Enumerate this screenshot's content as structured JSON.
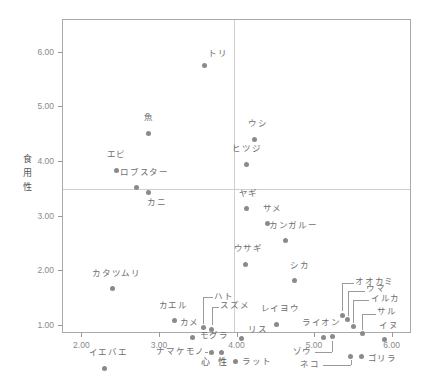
{
  "chart_data": {
    "type": "scatter",
    "title": "",
    "xlabel": "心 性",
    "ylabel": "食用性",
    "ylabel_chars": [
      "食",
      "用",
      "性"
    ],
    "xlim": [
      1.75,
      6.25
    ],
    "ylim": [
      0.85,
      6.6
    ],
    "grid": false,
    "legend": "none",
    "x_ticks": [
      2.0,
      3.0,
      4.0,
      5.0,
      6.0
    ],
    "x_tick_labels": [
      "2.00",
      "3.00",
      "4.00",
      "5.00",
      "6.00"
    ],
    "y_ticks": [
      1.0,
      2.0,
      3.0,
      4.0,
      5.0,
      6.0
    ],
    "y_tick_labels": [
      "1.00",
      "2.00",
      "3.00",
      "4.00",
      "5.00",
      "6.00"
    ],
    "reference_lines": {
      "vertical_x": 3.95,
      "horizontal_y": 3.5,
      "color": "#cfcfcf"
    },
    "marker_color": "#8a8a8a",
    "label_color": "#6e6e6e",
    "frame_color": "#aaaaaa",
    "points": [
      {
        "name": "トリ",
        "x": 3.57,
        "y": 5.76,
        "lx": 3.62,
        "ly": 5.98,
        "anchor": "left",
        "leader": false
      },
      {
        "name": "魚",
        "x": 2.85,
        "y": 4.52,
        "lx": 2.86,
        "ly": 4.8,
        "anchor": "center",
        "leader": false
      },
      {
        "name": "ウシ",
        "x": 4.22,
        "y": 4.42,
        "lx": 4.26,
        "ly": 4.7,
        "anchor": "center",
        "leader": false
      },
      {
        "name": "ヒツジ",
        "x": 4.11,
        "y": 3.96,
        "lx": 4.12,
        "ly": 4.24,
        "anchor": "center",
        "leader": false
      },
      {
        "name": "エビ",
        "x": 2.44,
        "y": 3.84,
        "lx": 2.44,
        "ly": 4.12,
        "anchor": "center",
        "leader": false
      },
      {
        "name": "ロブスター",
        "x": 2.7,
        "y": 3.53,
        "lx": 2.8,
        "ly": 3.8,
        "anchor": "center",
        "leader": false
      },
      {
        "name": "カニ",
        "x": 2.85,
        "y": 3.45,
        "lx": 2.96,
        "ly": 3.24,
        "anchor": "center",
        "leader": false
      },
      {
        "name": "ヤギ",
        "x": 4.12,
        "y": 3.15,
        "lx": 4.14,
        "ly": 3.42,
        "anchor": "center",
        "leader": false
      },
      {
        "name": "サメ",
        "x": 4.39,
        "y": 2.87,
        "lx": 4.45,
        "ly": 3.14,
        "anchor": "center",
        "leader": false
      },
      {
        "name": "カンガルー",
        "x": 4.62,
        "y": 2.56,
        "lx": 4.72,
        "ly": 2.82,
        "anchor": "center",
        "leader": false
      },
      {
        "name": "ウサギ",
        "x": 4.1,
        "y": 2.13,
        "lx": 4.14,
        "ly": 2.4,
        "anchor": "center",
        "leader": false
      },
      {
        "name": "シカ",
        "x": 4.73,
        "y": 1.83,
        "lx": 4.8,
        "ly": 2.1,
        "anchor": "center",
        "leader": false
      },
      {
        "name": "カタツムリ",
        "x": 2.39,
        "y": 1.68,
        "lx": 2.44,
        "ly": 1.95,
        "anchor": "center",
        "leader": false
      },
      {
        "name": "オオカミ",
        "x": 5.35,
        "y": 1.19,
        "lx": 5.52,
        "ly": 1.8,
        "anchor": "left",
        "leader": true,
        "leader_path": [
          [
            5.35,
            1.27
          ],
          [
            5.35,
            1.78
          ],
          [
            5.5,
            1.78
          ]
        ]
      },
      {
        "name": "カエル",
        "x": 3.19,
        "y": 1.1,
        "lx": 3.17,
        "ly": 1.37,
        "anchor": "center",
        "leader": false
      },
      {
        "name": "ハト",
        "x": 3.56,
        "y": 0.97,
        "lx": 3.7,
        "ly": 1.53,
        "anchor": "left",
        "leader": true,
        "leader_path": [
          [
            3.56,
            1.04
          ],
          [
            3.56,
            1.52
          ],
          [
            3.68,
            1.52
          ]
        ]
      },
      {
        "name": "ウマ",
        "x": 5.42,
        "y": 1.11,
        "lx": 5.66,
        "ly": 1.68,
        "anchor": "left",
        "leader": true,
        "leader_path": [
          [
            5.42,
            1.18
          ],
          [
            5.42,
            1.64
          ],
          [
            5.64,
            1.64
          ]
        ]
      },
      {
        "name": "レイヨウ",
        "x": 4.5,
        "y": 1.02,
        "lx": 4.55,
        "ly": 1.3,
        "anchor": "center",
        "leader": false
      },
      {
        "name": "スズメ",
        "x": 3.67,
        "y": 0.94,
        "lx": 3.78,
        "ly": 1.36,
        "anchor": "left",
        "leader": true,
        "leader_path": [
          [
            3.67,
            1.01
          ],
          [
            3.67,
            1.35
          ],
          [
            3.76,
            1.35
          ]
        ]
      },
      {
        "name": "イルカ",
        "x": 5.49,
        "y": 0.98,
        "lx": 5.72,
        "ly": 1.5,
        "anchor": "left",
        "leader": true,
        "leader_path": [
          [
            5.49,
            1.05
          ],
          [
            5.49,
            1.47
          ],
          [
            5.7,
            1.47
          ]
        ]
      },
      {
        "name": "ライオン",
        "x": 5.11,
        "y": 0.79,
        "lx": 5.08,
        "ly": 1.06,
        "anchor": "center",
        "leader": false
      },
      {
        "name": "サル",
        "x": 5.61,
        "y": 0.86,
        "lx": 5.8,
        "ly": 1.25,
        "anchor": "left",
        "leader": true,
        "leader_path": [
          [
            5.61,
            0.93
          ],
          [
            5.61,
            1.22
          ],
          [
            5.78,
            1.22
          ]
        ]
      },
      {
        "name": "カメ",
        "x": 3.42,
        "y": 0.78,
        "lx": 3.38,
        "ly": 1.06,
        "anchor": "center",
        "leader": false
      },
      {
        "name": "リス",
        "x": 4.05,
        "y": 0.77,
        "lx": 4.14,
        "ly": 0.93,
        "anchor": "left",
        "leader": false
      },
      {
        "name": "イヌ",
        "x": 5.89,
        "y": 0.75,
        "lx": 5.95,
        "ly": 1.0,
        "anchor": "center",
        "leader": false
      },
      {
        "name": "モグラ",
        "x": 3.79,
        "y": 0.52,
        "lx": 3.7,
        "ly": 0.82,
        "anchor": "center",
        "leader": false
      },
      {
        "name": "ゾウ",
        "x": 5.22,
        "y": 0.8,
        "lx": 4.96,
        "ly": 0.52,
        "anchor": "right",
        "leader": true,
        "leader_path": [
          [
            5.22,
            0.73
          ],
          [
            5.22,
            0.52
          ],
          [
            5.0,
            0.52
          ]
        ]
      },
      {
        "name": "ナマケモノ",
        "x": 3.66,
        "y": 0.52,
        "lx": 3.58,
        "ly": 0.52,
        "anchor": "right",
        "leader": true,
        "leader_path": [
          [
            3.62,
            0.52
          ],
          [
            3.58,
            0.52
          ]
        ]
      },
      {
        "name": "ゴリラ",
        "x": 5.6,
        "y": 0.43,
        "lx": 5.68,
        "ly": 0.4,
        "anchor": "left",
        "leader": false
      },
      {
        "name": "ネコ",
        "x": 5.46,
        "y": 0.44,
        "lx": 5.06,
        "ly": 0.28,
        "anchor": "right",
        "leader": true,
        "leader_path": [
          [
            5.46,
            0.37
          ],
          [
            5.46,
            0.28
          ],
          [
            5.1,
            0.28
          ]
        ]
      },
      {
        "name": "ラット",
        "x": 3.97,
        "y": 0.35,
        "lx": 4.06,
        "ly": 0.33,
        "anchor": "left",
        "leader": false
      },
      {
        "name": "イエバエ",
        "x": 2.29,
        "y": 0.22,
        "lx": 2.33,
        "ly": 0.5,
        "anchor": "center",
        "leader": false
      }
    ]
  }
}
